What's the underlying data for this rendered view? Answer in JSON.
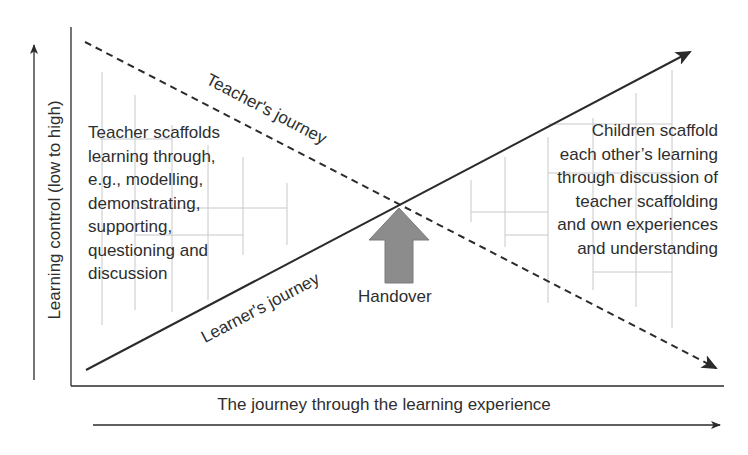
{
  "diagram": {
    "type": "crossing-journeys",
    "y_axis_label": "Learning control (low to high)",
    "x_axis_label": "The journey through the learning experience",
    "lines": {
      "teacher": {
        "label": "Teacher's journey",
        "style": "dashed",
        "direction": "descending"
      },
      "learner": {
        "label": "Learner's journey",
        "style": "solid",
        "direction": "ascending"
      }
    },
    "handover": {
      "label": "Handover",
      "color": "#8c8c8c"
    },
    "left_text": {
      "lines": [
        "Teacher scaffolds",
        "learning through,",
        "e.g., modelling,",
        "demonstrating,",
        "supporting,",
        "questioning and",
        "discussion"
      ]
    },
    "right_text": {
      "lines": [
        "Children scaffold",
        "each other’s learning",
        "through discussion of",
        "teacher scaffolding",
        "and own experiences",
        "and understanding"
      ]
    },
    "colors": {
      "line": "#2b2b2b",
      "arrow_fill": "#8c8c8c",
      "grid": "#c8c8c8",
      "text": "#2e2e2e"
    }
  }
}
